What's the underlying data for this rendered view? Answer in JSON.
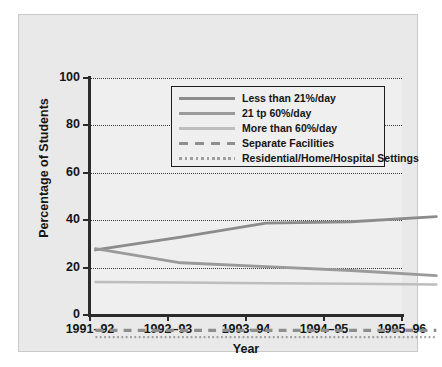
{
  "chart_data": {
    "type": "line",
    "title": "",
    "xlabel": "Year",
    "ylabel": "Percentage of Students",
    "categories": [
      "1991–92",
      "1992–93",
      "1993–94",
      "1994–95",
      "1995–96"
    ],
    "ylim": [
      0,
      100
    ],
    "yticks": [
      0,
      20,
      40,
      60,
      80,
      100
    ],
    "grid": "horizontal-dotted",
    "legend_position": "upper-center-inside",
    "series": [
      {
        "name": "Less than 21%/day",
        "values": [
          35.0,
          40.0,
          45.5,
          46.0,
          48.0
        ],
        "color": "#8c8c8c",
        "style": "solid",
        "width": 2.6
      },
      {
        "name": "21 tp 60%/day",
        "values": [
          35.5,
          30.0,
          28.5,
          27.0,
          25.0
        ],
        "color": "#9a9a9a",
        "style": "solid",
        "width": 2.6
      },
      {
        "name": "More than 60%/day",
        "values": [
          22.5,
          22.3,
          22.0,
          21.8,
          21.5
        ],
        "color": "#bdbdbd",
        "style": "solid",
        "width": 2.2
      },
      {
        "name": "Separate Facilities",
        "values": [
          3.6,
          3.6,
          3.6,
          3.6,
          3.6
        ],
        "color": "#8e8e8e",
        "style": "dashed",
        "width": 3.0
      },
      {
        "name": "Residential/Home/Hospital Settings",
        "values": [
          1.0,
          1.0,
          1.0,
          1.0,
          1.0
        ],
        "color": "#9e9e9e",
        "style": "dotted",
        "width": 2.2
      }
    ]
  },
  "axis": {
    "y_title": "Percentage of Students",
    "x_title": "Year",
    "y_tick_labels": [
      "0",
      "20",
      "40",
      "60",
      "80",
      "100"
    ],
    "x_tick_labels": [
      "1991–92",
      "1992–93",
      "1993–94",
      "1994–95",
      "1995–96"
    ]
  },
  "legend": {
    "items": [
      {
        "label": "Less than 21%/day"
      },
      {
        "label": "21 tp 60%/day"
      },
      {
        "label": "More than 60%/day"
      },
      {
        "label": "Separate Facilities"
      },
      {
        "label": "Residential/Home/Hospital Settings"
      }
    ]
  },
  "colors": {
    "panel_bg": "#e9e9e9",
    "plot_bg": "#efefef",
    "axis": "#2b2b2b",
    "text": "#151515",
    "grid": "#3a3a3a"
  }
}
